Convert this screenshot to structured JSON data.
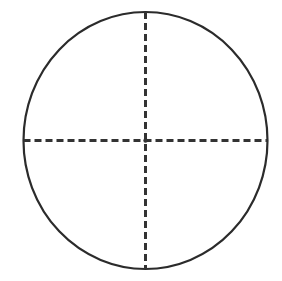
{
  "canvas": {
    "width": 282,
    "height": 281,
    "background_color": "#ffffff",
    "title": "Circle with dashed vertical and horizontal diameters"
  },
  "chart_data": {
    "type": "diagram",
    "title": "",
    "subtitle": "",
    "xlabel": "",
    "ylabel": "",
    "grid": false,
    "legend": null,
    "annotations": [],
    "shapes": [
      {
        "name": "circle-outline",
        "kind": "ellipse",
        "center_x": 145.5,
        "center_y": 140.5,
        "radius_x": 122.0,
        "radius_y": 128.5,
        "stroke_color": "#2b2b2b",
        "stroke_width": 2.2,
        "fill": "none",
        "dash": "solid"
      },
      {
        "name": "vertical-diameter",
        "kind": "line",
        "x1": 145.5,
        "y1": 12.0,
        "x2": 145.5,
        "y2": 269.0,
        "stroke_color": "#333333",
        "stroke_width": 3.0,
        "dash": "dashed",
        "dash_length": 7,
        "gap_length": 4
      },
      {
        "name": "horizontal-diameter",
        "kind": "line",
        "x1": 23.5,
        "y1": 140.5,
        "x2": 267.5,
        "y2": 140.5,
        "stroke_color": "#333333",
        "stroke_width": 3.0,
        "dash": "dashed",
        "dash_length": 7,
        "gap_length": 4
      },
      {
        "name": "center-point",
        "kind": "point",
        "x": 145.5,
        "y": 140.5,
        "color": "#333333",
        "size": 3.5
      }
    ]
  }
}
